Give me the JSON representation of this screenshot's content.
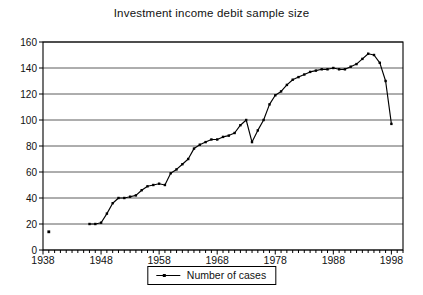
{
  "title": "Investment income debit sample size",
  "legend": {
    "label": "Number of cases"
  },
  "colors": {
    "line": "#000000",
    "grid": "#333333",
    "border": "#000000",
    "background": "#ffffff",
    "text": "#111111"
  },
  "chart_data": {
    "type": "line",
    "title": "Investment income debit sample size",
    "xlabel": "",
    "ylabel": "",
    "xlim": [
      1938,
      2000
    ],
    "ylim": [
      0,
      160
    ],
    "x_ticks": [
      1938,
      1948,
      1958,
      1968,
      1978,
      1988,
      1998
    ],
    "y_ticks": [
      0,
      20,
      40,
      60,
      80,
      100,
      120,
      140,
      160
    ],
    "grid": "horizontal",
    "legend_position": "bottom-center",
    "series": [
      {
        "name": "Number of cases",
        "x": [
          1946,
          1947,
          1948,
          1949,
          1950,
          1951,
          1952,
          1953,
          1954,
          1955,
          1956,
          1957,
          1958,
          1959,
          1960,
          1961,
          1962,
          1963,
          1964,
          1965,
          1966,
          1967,
          1968,
          1969,
          1970,
          1971,
          1972,
          1973,
          1974,
          1975,
          1976,
          1977,
          1978,
          1979,
          1980,
          1981,
          1982,
          1983,
          1984,
          1985,
          1986,
          1987,
          1988,
          1989,
          1990,
          1991,
          1992,
          1993,
          1994,
          1995,
          1996,
          1997,
          1998
        ],
        "values": [
          20,
          20,
          21,
          28,
          36,
          40,
          40,
          41,
          42,
          46,
          49,
          50,
          51,
          50,
          59,
          62,
          66,
          70,
          78,
          81,
          83,
          85,
          85,
          87,
          88,
          90,
          96,
          100,
          83,
          92,
          100,
          112,
          119,
          122,
          127,
          131,
          133,
          135,
          137,
          138,
          139,
          139,
          140,
          139,
          139,
          141,
          143,
          147,
          151,
          150,
          144,
          130,
          97
        ]
      }
    ],
    "isolated_points": [
      {
        "x": 1939,
        "y": 14
      }
    ]
  }
}
